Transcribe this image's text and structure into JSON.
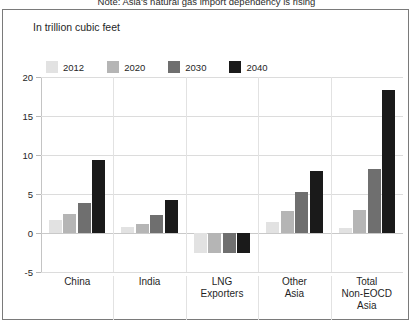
{
  "figure": {
    "title": "Note: Asia's natural gas import dependency is rising",
    "units_label": "In trillion cubic feet"
  },
  "chart_data": {
    "type": "bar",
    "title": "In trillion cubic feet",
    "xlabel": "",
    "ylabel": "",
    "ylim": [
      -5,
      20
    ],
    "yticks": [
      20,
      15,
      10,
      5,
      0,
      -5
    ],
    "ytick_labels": [
      "20",
      "15",
      "10",
      "5",
      "0",
      "-5"
    ],
    "grid": true,
    "legend_position": "top-left",
    "categories": [
      "China",
      "India",
      "LNG\nExporters",
      "Other\nAsia",
      "Total\nNon-EOCD\nAsia"
    ],
    "series": [
      {
        "name": "2012",
        "color": "#e2e2e2",
        "values": [
          1.7,
          0.8,
          -2.6,
          1.4,
          0.6
        ]
      },
      {
        "name": "2020",
        "color": "#b5b5b5",
        "values": [
          2.4,
          1.1,
          -2.6,
          2.8,
          3.0
        ]
      },
      {
        "name": "2030",
        "color": "#6f6f6f",
        "values": [
          3.8,
          2.3,
          -2.6,
          5.3,
          8.2
        ]
      },
      {
        "name": "2040",
        "color": "#1a1a1a",
        "values": [
          9.4,
          4.2,
          -2.6,
          7.9,
          18.3
        ]
      }
    ]
  },
  "category_labels": [
    [
      "China"
    ],
    [
      "India"
    ],
    [
      "LNG",
      "Exporters"
    ],
    [
      "Other",
      "Asia"
    ],
    [
      "Total",
      "Non-EOCD",
      "Asia"
    ]
  ]
}
